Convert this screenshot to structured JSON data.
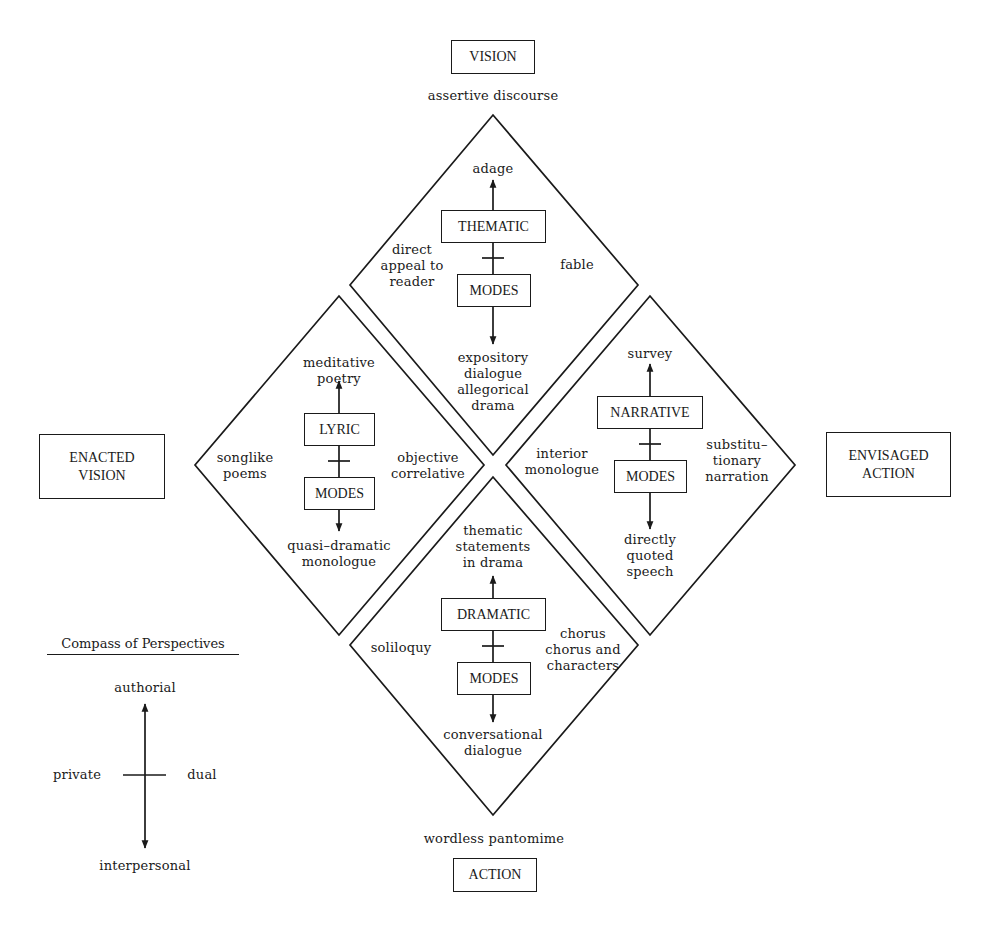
{
  "poles": {
    "top": {
      "label": "VISION",
      "sublabel": "assertive discourse"
    },
    "bottom": {
      "label": "ACTION",
      "sublabel": "wordless pantomime"
    },
    "left": {
      "label": "ENACTED\nVISION"
    },
    "right": {
      "label": "ENVISAGED\nACTION"
    }
  },
  "diamonds": {
    "thematic": {
      "upper_box": "THEMATIC",
      "lower_box": "MODES",
      "top": "adage",
      "bottom": "expository\ndialogue\nallegorical\ndrama",
      "left": "direct\nappeal to\nreader",
      "right": "fable"
    },
    "lyric": {
      "upper_box": "LYRIC",
      "lower_box": "MODES",
      "top": "meditative\npoetry",
      "bottom": "quasi–dramatic\nmonologue",
      "left": "songlike\npoems",
      "right": "objective\ncorrelative"
    },
    "narrative": {
      "upper_box": "NARRATIVE",
      "lower_box": "MODES",
      "top": "survey",
      "bottom": "directly\nquoted\nspeech",
      "left": "interior\nmonologue",
      "right": "substitu–\ntionary\nnarration"
    },
    "dramatic": {
      "upper_box": "DRAMATIC",
      "lower_box": "MODES",
      "top": "thematic\nstatements\nin drama",
      "bottom": "conversational\ndialogue",
      "left": "soliloquy",
      "right": "chorus\nchorus and\ncharacters"
    }
  },
  "legend": {
    "title": "Compass of Perspectives",
    "top": "authorial",
    "bottom": "interpersonal",
    "left": "private",
    "right": "dual"
  },
  "colors": {
    "ink": "#1a1a1a",
    "background": "#ffffff"
  }
}
